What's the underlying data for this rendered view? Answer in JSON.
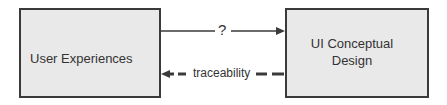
{
  "diagram": {
    "nodes": [
      {
        "id": "user-experiences",
        "label": "User Experiences"
      },
      {
        "id": "ui-conceptual-design",
        "label_lines": [
          "UI Conceptual",
          "Design"
        ]
      }
    ],
    "edges": [
      {
        "from": "user-experiences",
        "to": "ui-conceptual-design",
        "style": "solid",
        "label": "?"
      },
      {
        "from": "ui-conceptual-design",
        "to": "user-experiences",
        "style": "dashed",
        "label": "traceability"
      }
    ],
    "colors": {
      "box_fill": "#e9e9e9",
      "stroke": "#3a3a3a",
      "text": "#333333"
    }
  }
}
